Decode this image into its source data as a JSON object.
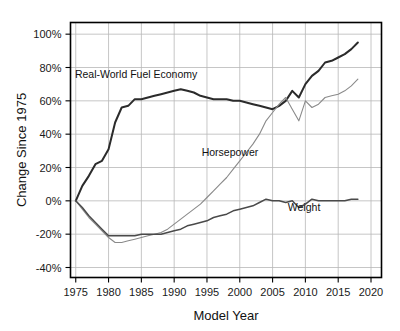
{
  "chart_data": {
    "type": "line",
    "title": "",
    "xlabel": "Model Year",
    "ylabel": "Change Since 1975",
    "xlim": [
      1974.2,
      2021.6
    ],
    "ylim": [
      -46,
      107
    ],
    "grid": true,
    "legend_position": "inline-annotations",
    "xticks": [
      1975,
      1980,
      1985,
      1990,
      1995,
      2000,
      2005,
      2010,
      2015,
      2020
    ],
    "xtick_labels": [
      "1975",
      "1980",
      "1985",
      "1990",
      "1995",
      "2000",
      "2005",
      "2010",
      "2015",
      "2020"
    ],
    "yticks": [
      -40,
      -20,
      0,
      20,
      40,
      60,
      80,
      100
    ],
    "ytick_labels": [
      "-40%",
      "-20%",
      "0%",
      "20%",
      "40%",
      "60%",
      "80%",
      "100%"
    ],
    "x": [
      1975,
      1976,
      1977,
      1978,
      1979,
      1980,
      1981,
      1982,
      1983,
      1984,
      1985,
      1986,
      1987,
      1988,
      1989,
      1990,
      1991,
      1992,
      1993,
      1994,
      1995,
      1996,
      1997,
      1998,
      1999,
      2000,
      2001,
      2002,
      2003,
      2004,
      2005,
      2006,
      2007,
      2008,
      2009,
      2010,
      2011,
      2012,
      2013,
      2014,
      2015,
      2016,
      2017,
      2018
    ],
    "series": [
      {
        "name": "Real-World Fuel Economy",
        "label": "Real-World Fuel Economy",
        "color": "#2b2b2b",
        "line_width": 2.0,
        "label_x": 1984.2,
        "label_y": 74,
        "values": [
          0,
          9,
          15,
          22,
          24,
          31,
          47,
          56,
          57,
          61,
          61,
          62,
          63,
          64,
          65,
          66,
          67,
          66,
          65,
          63,
          62,
          61,
          61,
          61,
          60,
          60,
          59,
          58,
          57,
          56,
          55,
          57,
          60,
          66,
          62,
          70,
          75,
          78,
          83,
          84,
          86,
          88,
          91,
          95
        ]
      },
      {
        "name": "Horsepower",
        "label": "Horsepower",
        "color": "#8a8a8a",
        "line_width": 1.1,
        "label_x": 1998.5,
        "label_y": 27,
        "values": [
          0,
          -5,
          -10,
          -14,
          -18,
          -22,
          -25,
          -25,
          -24,
          -23,
          -22,
          -21,
          -20,
          -19,
          -17,
          -14,
          -11,
          -8,
          -5,
          -2,
          2,
          6,
          10,
          14,
          19,
          24,
          29,
          34,
          40,
          48,
          53,
          58,
          62,
          55,
          48,
          60,
          56,
          58,
          62,
          63,
          64,
          66,
          69,
          73
        ]
      },
      {
        "name": "Weight",
        "label": "Weight",
        "color": "#4a4a4a",
        "line_width": 1.5,
        "label_x": 2009.8,
        "label_y": -6,
        "values": [
          0,
          -4,
          -9,
          -13,
          -17,
          -21,
          -21,
          -21,
          -21,
          -21,
          -20,
          -20,
          -20,
          -20,
          -19,
          -18,
          -17,
          -15,
          -14,
          -13,
          -12,
          -10,
          -9,
          -8,
          -6,
          -5,
          -4,
          -3,
          -1,
          1,
          0,
          0,
          -1,
          0,
          -4,
          -2,
          1,
          0,
          0,
          0,
          0,
          0,
          1,
          1
        ]
      }
    ]
  }
}
